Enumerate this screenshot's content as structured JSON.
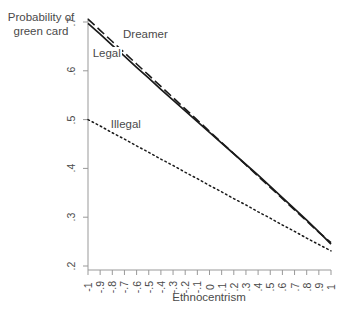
{
  "chart_data": {
    "type": "line",
    "title": "",
    "xlabel": "Ethnocentrism",
    "ylabel": "Probability of\ngreen card",
    "ylabel_line1": "Probability of",
    "ylabel_line2": "green card",
    "xlim": [
      -1,
      1
    ],
    "ylim": [
      0.2,
      0.7
    ],
    "grid": false,
    "legend_position": "inline-annotations",
    "xticks": [
      -1,
      -0.9,
      -0.8,
      -0.7,
      -0.6,
      -0.5,
      -0.4,
      -0.3,
      -0.2,
      -0.1,
      0,
      0.1,
      0.2,
      0.3,
      0.4,
      0.5,
      0.6,
      0.7,
      0.8,
      0.9,
      1
    ],
    "xtick_labels": [
      "-1",
      "-.9",
      "-.8",
      "-.7",
      "-.6",
      "-.5",
      "-.4",
      "-.3",
      "-.2",
      "-.1",
      "0",
      ".1",
      ".2",
      ".3",
      ".4",
      ".5",
      ".6",
      ".7",
      ".8",
      ".9",
      "1"
    ],
    "yticks": [
      0.2,
      0.3,
      0.4,
      0.5,
      0.6,
      0.7
    ],
    "ytick_labels": [
      ".2",
      ".3",
      ".4",
      ".5",
      ".6",
      ".7"
    ],
    "x": [
      -1,
      -0.9,
      -0.8,
      -0.7,
      -0.6,
      -0.5,
      -0.4,
      -0.3,
      -0.2,
      -0.1,
      0,
      0.1,
      0.2,
      0.3,
      0.4,
      0.5,
      0.6,
      0.7,
      0.8,
      0.9,
      1
    ],
    "series": [
      {
        "name": "Dreamer",
        "style": "dashed",
        "color": "#1a1a1a",
        "values": [
          0.706,
          0.683,
          0.66,
          0.637,
          0.614,
          0.591,
          0.568,
          0.545,
          0.522,
          0.499,
          0.476,
          0.453,
          0.43,
          0.407,
          0.384,
          0.361,
          0.338,
          0.315,
          0.292,
          0.269,
          0.248
        ]
      },
      {
        "name": "Legal",
        "style": "solid",
        "color": "#1a1a1a",
        "values": [
          0.697,
          0.675,
          0.652,
          0.63,
          0.607,
          0.585,
          0.562,
          0.54,
          0.518,
          0.496,
          0.474,
          0.452,
          0.43,
          0.408,
          0.386,
          0.363,
          0.34,
          0.317,
          0.294,
          0.27,
          0.245
        ]
      },
      {
        "name": "Illegal",
        "style": "dotted",
        "color": "#1a1a1a",
        "values": [
          0.5,
          0.487,
          0.473,
          0.46,
          0.446,
          0.433,
          0.419,
          0.406,
          0.392,
          0.379,
          0.365,
          0.352,
          0.338,
          0.325,
          0.311,
          0.298,
          0.284,
          0.271,
          0.257,
          0.244,
          0.231
        ]
      }
    ],
    "annotations": [
      {
        "text": "Dreamer",
        "x": -0.72,
        "y": 0.672
      },
      {
        "text": "Legal",
        "x": -0.97,
        "y": 0.632
      },
      {
        "text": "Illegal",
        "x": -0.82,
        "y": 0.487
      }
    ]
  },
  "axis_style": {
    "axis_color": "#999999",
    "line_color": "#1a1a1a",
    "text_color": "#4a4a4a"
  }
}
